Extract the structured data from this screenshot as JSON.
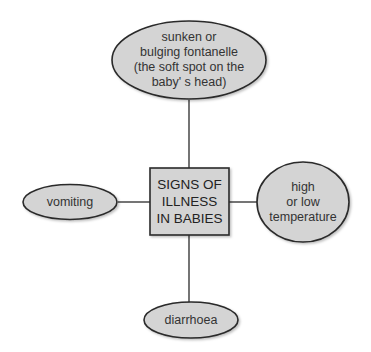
{
  "diagram": {
    "center": {
      "label": "SIGNS OF\nILLNESS\nIN BABIES"
    },
    "nodes": {
      "top": {
        "label": "sunken or\nbulging fontanelle\n(the soft spot on the\nbaby' s head)"
      },
      "left": {
        "label": "vomiting"
      },
      "right": {
        "label": "high\nor low\ntemperature"
      },
      "bottom": {
        "label": "diarrhoea"
      }
    },
    "colors": {
      "fill": "#d4d4d4",
      "stroke": "#2a2a2a",
      "text": "#333333"
    }
  }
}
